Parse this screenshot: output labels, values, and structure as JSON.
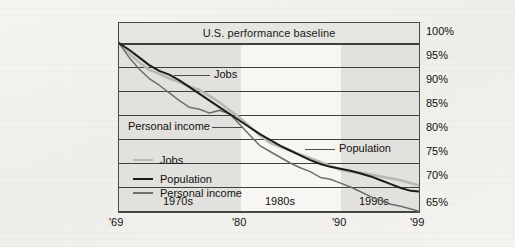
{
  "figure": {
    "baseline_label": "U.S. performance baseline"
  },
  "axes": {
    "y_ticks": [
      "100%",
      "95%",
      "90%",
      "85%",
      "80%",
      "75%",
      "70%",
      "65%"
    ],
    "x_ticks": [
      "'69",
      "'80",
      "'90",
      "'99"
    ],
    "decade_labels": [
      "1970s",
      "1980s",
      "1990s"
    ]
  },
  "annotations": [
    {
      "name": "jobs",
      "text": "Jobs"
    },
    {
      "name": "personal-income",
      "text": "Personal income"
    },
    {
      "name": "population",
      "text": "Population"
    }
  ],
  "legend": {
    "items": [
      {
        "label": "Jobs",
        "color": "#b9b8b4"
      },
      {
        "label": "Population",
        "color": "#1c1c1c"
      },
      {
        "label": "Personal income",
        "color": "#6f6e6b"
      }
    ]
  },
  "chart_data": {
    "type": "line",
    "title": "U.S. performance baseline",
    "xlabel": "",
    "ylabel": "",
    "xlim": [
      1969,
      1999
    ],
    "ylim": [
      65,
      100
    ],
    "y_unit": "percent",
    "grid": true,
    "legend_position": "inside-lower-left",
    "x": [
      1969,
      1970,
      1971,
      1972,
      1973,
      1974,
      1975,
      1976,
      1977,
      1978,
      1979,
      1980,
      1981,
      1982,
      1983,
      1984,
      1985,
      1986,
      1987,
      1988,
      1989,
      1990,
      1991,
      1992,
      1993,
      1994,
      1995,
      1996,
      1997,
      1998,
      1999
    ],
    "series": [
      {
        "name": "Jobs",
        "color": "#b9b8b4",
        "values": [
          100.0,
          97.8,
          96.0,
          94.4,
          93.6,
          92.6,
          91.8,
          91.0,
          90.2,
          89.0,
          87.6,
          86.0,
          84.4,
          82.6,
          80.8,
          79.2,
          78.4,
          77.6,
          76.8,
          76.0,
          75.2,
          74.4,
          73.6,
          73.2,
          73.0,
          72.6,
          72.2,
          71.8,
          71.4,
          70.8,
          70.2
        ]
      },
      {
        "name": "Population",
        "color": "#1c1c1c",
        "values": [
          100.0,
          98.6,
          97.0,
          95.4,
          94.2,
          93.4,
          92.2,
          90.8,
          89.4,
          88.0,
          86.6,
          85.2,
          83.8,
          82.4,
          81.0,
          79.8,
          78.6,
          77.6,
          76.6,
          75.6,
          74.8,
          74.2,
          73.8,
          73.4,
          72.8,
          72.2,
          71.4,
          70.6,
          69.8,
          69.2,
          69.0
        ]
      },
      {
        "name": "Personal income",
        "color": "#6f6e6b",
        "values": [
          100.0,
          97.0,
          94.6,
          92.6,
          91.2,
          89.6,
          88.0,
          86.6,
          86.2,
          85.4,
          86.0,
          85.2,
          83.0,
          80.8,
          78.6,
          77.4,
          76.2,
          75.0,
          74.0,
          73.2,
          72.0,
          71.6,
          70.8,
          70.0,
          69.0,
          68.0,
          67.2,
          66.4,
          66.0,
          65.4,
          64.8
        ]
      }
    ]
  }
}
